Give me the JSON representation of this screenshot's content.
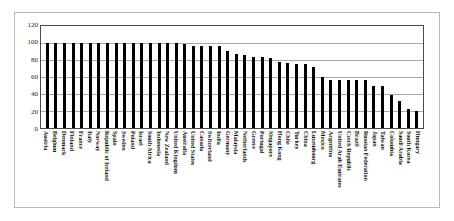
{
  "chart_data": {
    "type": "bar",
    "title": "",
    "subtitle": "",
    "xlabel": "",
    "ylabel": "",
    "ylim": [
      0,
      120
    ],
    "yticks": [
      0,
      20,
      40,
      60,
      80,
      100,
      120
    ],
    "grid": true,
    "legend": false,
    "legend_position": "none",
    "bar_color": "#000000",
    "categories": [
      "Austria",
      "Belgium",
      "Denmark",
      "Finland",
      "France",
      "Italy",
      "Norway",
      "Republic of Ireland",
      "Spain",
      "Sweden",
      "Poland",
      "Israel",
      "South Africa",
      "Indonesia",
      "New Zealand",
      "United Kingdom",
      "Australia",
      "United States",
      "Canada",
      "Switzerland",
      "India",
      "Germany",
      "Malaysia",
      "Netherlands",
      "Greece",
      "Portugal",
      "Singapore",
      "Hong Kong",
      "Chile",
      "Turkey",
      "China",
      "Luxembourg",
      "Mexico",
      "Argentina",
      "United Arab Emirates",
      "Czech Republic",
      "Brazil",
      "Russian Federation",
      "Japan",
      "Taiwan",
      "Colombia",
      "Saudi Arabia",
      "South Korea",
      "Hungary"
    ],
    "values": [
      100,
      100,
      100,
      100,
      100,
      100,
      100,
      100,
      100,
      100,
      100,
      100,
      100,
      100,
      100,
      100,
      99,
      97,
      97,
      97,
      96,
      91,
      87,
      86,
      84,
      84,
      82,
      78,
      76,
      75,
      75,
      72,
      60,
      57,
      57,
      57,
      57,
      57,
      50,
      49,
      39,
      32,
      22,
      20
    ]
  },
  "axis": {
    "y_tick_labels": [
      "120",
      "100",
      "80",
      "60",
      "40",
      "20",
      "0"
    ]
  }
}
